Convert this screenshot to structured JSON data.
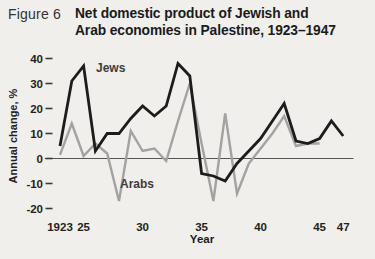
{
  "figure": {
    "label": "Figure 6",
    "title_line1": "Net domestic product of Jewish and",
    "title_line2": "Arab economies in Palestine, 1923–1947"
  },
  "chart_data": {
    "type": "line",
    "title": "Net domestic product of Jewish and Arab economies in Palestine, 1923–1947",
    "xlabel": "Year",
    "ylabel": "Annual change, %",
    "ylim": [
      -20,
      40
    ],
    "xlim": [
      1923,
      1947
    ],
    "grid": false,
    "legend_position": "inline-labels",
    "yticks": [
      40,
      30,
      20,
      10,
      0,
      -10,
      -20
    ],
    "xticks": [
      {
        "label": "1923",
        "year": 1923
      },
      {
        "label": "25",
        "year": 1925
      },
      {
        "label": "30",
        "year": 1930
      },
      {
        "label": "35",
        "year": 1935
      },
      {
        "label": "40",
        "year": 1940
      },
      {
        "label": "45",
        "year": 1945
      },
      {
        "label": "47",
        "year": 1947
      }
    ],
    "series": [
      {
        "name": "Jews",
        "color": "#1c1c1c",
        "line_width": 2.8,
        "start_year": 1923,
        "end_year": 1947,
        "values": [
          5,
          31,
          37,
          3,
          10,
          10,
          16,
          21,
          17,
          21,
          38,
          33,
          -6,
          -7,
          -9,
          -2,
          3,
          8,
          15,
          22,
          7,
          6,
          8,
          15,
          9
        ]
      },
      {
        "name": "Arabs",
        "color": "#a2a2a2",
        "line_width": 2.4,
        "start_year": 1923,
        "end_year": 1945,
        "values": [
          1.5,
          14,
          1,
          6,
          2,
          -17,
          11,
          3,
          4,
          -1,
          15,
          30,
          6,
          -17,
          18,
          -14,
          -2,
          4,
          10,
          17,
          5,
          6,
          6
        ]
      }
    ],
    "axis_color": "#555555",
    "tick_color": "#3a3a3a",
    "background_color": "#f0efec"
  }
}
